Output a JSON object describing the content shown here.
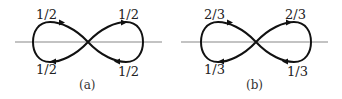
{
  "figure": {
    "panels": [
      {
        "caption": "(a)",
        "labels": {
          "top_left": "1/2",
          "top_right": "1/2",
          "bottom_left": "1/2",
          "bottom_right": "1/2"
        }
      },
      {
        "caption": "(b)",
        "labels": {
          "top_left": "2/3",
          "top_right": "2/3",
          "bottom_left": "1/3",
          "bottom_right": "1/3"
        }
      }
    ],
    "colors": {
      "curve": "#111111",
      "axis": "#888888"
    }
  }
}
